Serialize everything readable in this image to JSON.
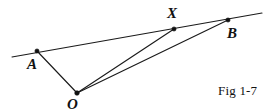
{
  "figure": {
    "caption": "Fig 1-7",
    "canvas": {
      "width": 279,
      "height": 112
    },
    "background_color": "#ffffff",
    "ink_color": "#111111"
  },
  "geometry": {
    "type": "euclidean-diagram",
    "points": [
      {
        "id": "A",
        "label": "A",
        "x": 37,
        "y": 51
      },
      {
        "id": "X",
        "label": "X",
        "x": 174,
        "y": 29
      },
      {
        "id": "B",
        "label": "B",
        "x": 228,
        "y": 20
      },
      {
        "id": "O",
        "label": "O",
        "x": 77,
        "y": 93
      }
    ],
    "lines": [
      {
        "id": "line-ab",
        "name": "line-through-A-X-B",
        "x1": 12,
        "y1": 57,
        "x2": 262,
        "y2": 13
      }
    ],
    "segments": [
      {
        "id": "seg-OA",
        "name": "segment-O-A",
        "from": "O",
        "to": "A",
        "x1": 77,
        "y1": 93,
        "x2": 37,
        "y2": 51
      },
      {
        "id": "seg-OX",
        "name": "segment-O-X",
        "from": "O",
        "to": "X",
        "x1": 77,
        "y1": 93,
        "x2": 174,
        "y2": 29
      },
      {
        "id": "seg-OB",
        "name": "segment-O-B",
        "from": "O",
        "to": "B",
        "x1": 77,
        "y1": 93,
        "x2": 228,
        "y2": 20
      }
    ],
    "labels": {
      "A": "A",
      "X": "X",
      "B": "B",
      "O": "O"
    }
  }
}
